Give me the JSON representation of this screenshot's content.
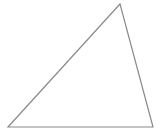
{
  "diagram": {
    "shape": "triangle",
    "stroke_color": "#8a8a8a",
    "fill_color": "#ffffff",
    "stroke_width": "1.2",
    "points": "120,4 8,127 153,127"
  }
}
